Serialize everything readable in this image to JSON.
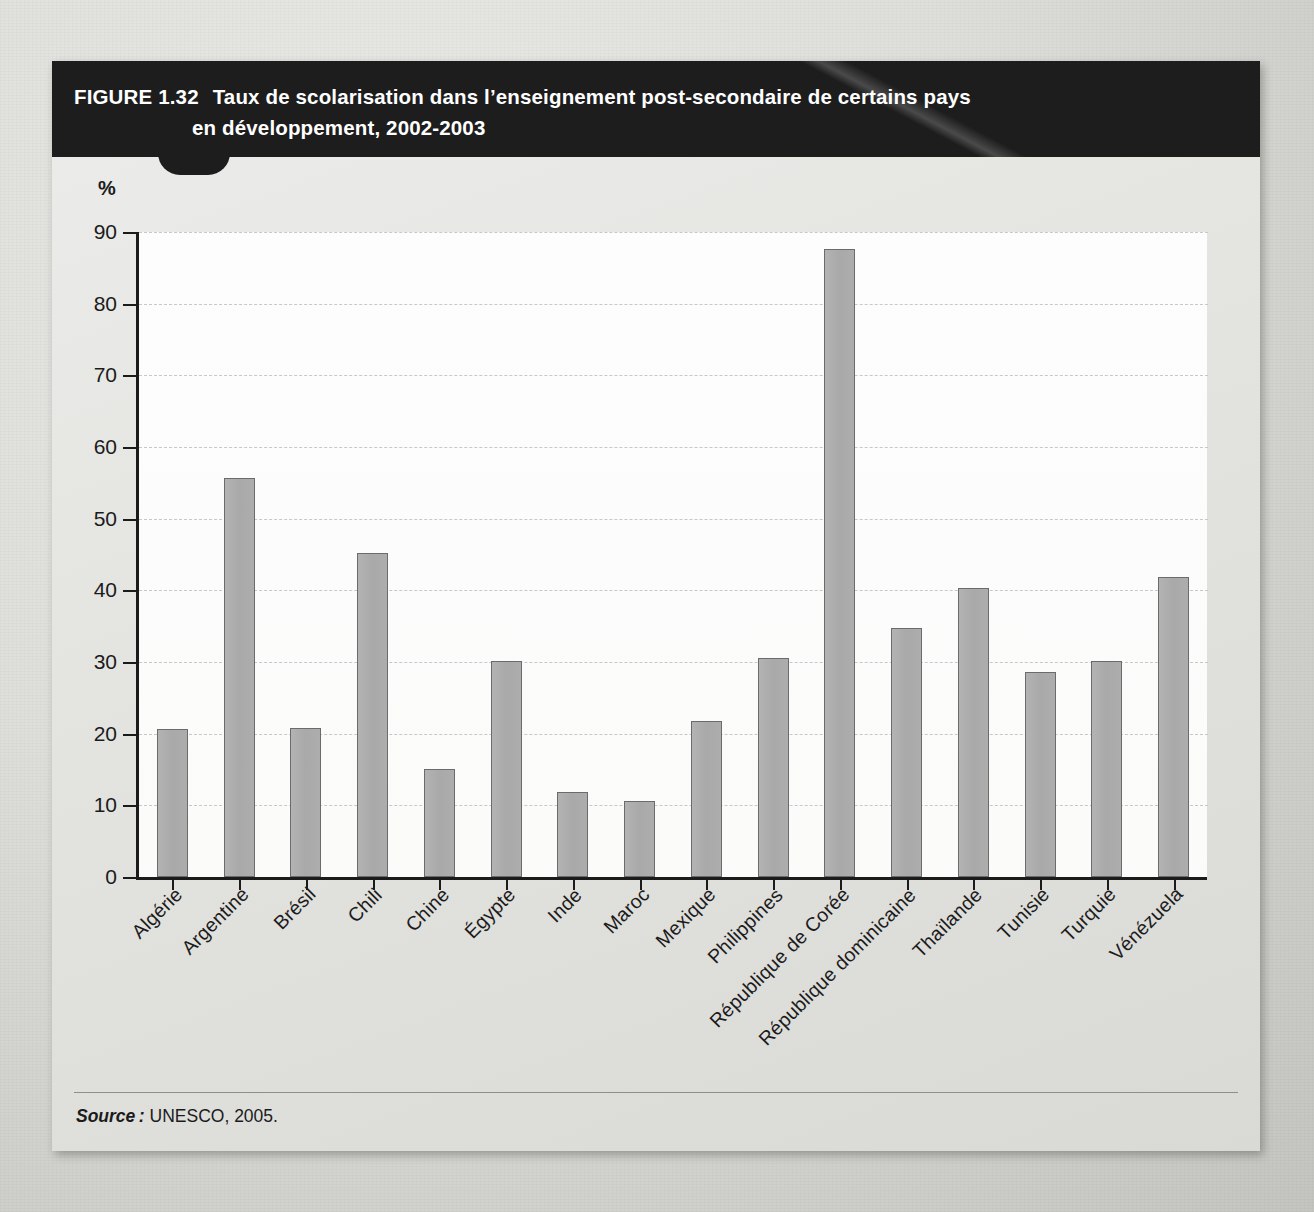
{
  "figure": {
    "label": "FIGURE 1.32",
    "title_line1": "Taux de scolarisation dans l’enseignement post-secondaire de certains pays",
    "title_line2": "en développement, 2002-2003",
    "unit_label": "%",
    "source_prefix": "Source :",
    "source_text": " UNESCO, 2005."
  },
  "colors": {
    "title_bar": "#1d1d1d",
    "bar_fill": "#ababab",
    "bar_stroke": "#6b6b6b",
    "axis": "#1b1b1b",
    "grid": "#c8c8c8",
    "card_bg": "#e6e6e3",
    "page_bg": "#d6d6d2"
  },
  "chart_data": {
    "type": "bar",
    "title": "Taux de scolarisation dans l’enseignement post-secondaire de certains pays en développement, 2002-2003",
    "xlabel": "",
    "ylabel": "%",
    "ylim": [
      0,
      90
    ],
    "ytick_step": 10,
    "yticks": [
      0,
      10,
      20,
      30,
      40,
      50,
      60,
      70,
      80,
      90
    ],
    "ytick_labels": [
      "0",
      "10",
      "20",
      "30",
      "40",
      "50",
      "60",
      "70",
      "80",
      "90"
    ],
    "grid": true,
    "grid_style": "dashed-horizontal",
    "legend": false,
    "legend_position": "none",
    "source": "UNESCO, 2005.",
    "categories": [
      "Algérie",
      "Argentine",
      "Brésil",
      "Chili",
      "Chine",
      "Égypte",
      "Inde",
      "Maroc",
      "Mexique",
      "Philippines",
      "République de Corée",
      "République dominicaine",
      "Thaïlande",
      "Tunisie",
      "Turquie",
      "Vénézuela"
    ],
    "values": [
      20.7,
      55.7,
      20.8,
      45.2,
      15.1,
      30.2,
      11.9,
      10.6,
      21.8,
      30.6,
      87.6,
      34.7,
      40.3,
      28.6,
      30.1,
      41.9
    ]
  }
}
